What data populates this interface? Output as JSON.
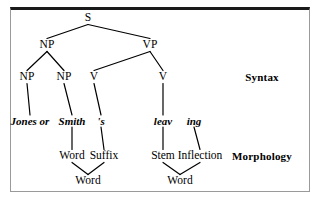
{
  "figure": {
    "border_color": "#9a9a9a",
    "top_border_color": "#1a1a1a",
    "line_color": "#000000",
    "background": "#ffffff"
  },
  "tiers": {
    "syntax_label": "Syntax",
    "morphology_label": "Morphology"
  },
  "tree": {
    "type": "constituency-tree",
    "nodes": [
      {
        "id": "S",
        "label": "S",
        "x": 88,
        "y": 18,
        "kind": "category"
      },
      {
        "id": "NP1",
        "label": "NP",
        "x": 47,
        "y": 45,
        "kind": "category"
      },
      {
        "id": "VP",
        "label": "VP",
        "x": 150,
        "y": 45,
        "kind": "category"
      },
      {
        "id": "NP2",
        "label": "NP",
        "x": 27,
        "y": 77,
        "kind": "category"
      },
      {
        "id": "NP3",
        "label": "NP",
        "x": 64,
        "y": 77,
        "kind": "category"
      },
      {
        "id": "V1",
        "label": "V",
        "x": 94,
        "y": 77,
        "kind": "category"
      },
      {
        "id": "V2",
        "label": "V",
        "x": 163,
        "y": 77,
        "kind": "category"
      },
      {
        "id": "w-jones",
        "label": "Jones or",
        "x": 30,
        "y": 121,
        "kind": "word"
      },
      {
        "id": "w-smith",
        "label": "Smith",
        "x": 72,
        "y": 121,
        "kind": "word"
      },
      {
        "id": "w-s",
        "label": "'s",
        "x": 101,
        "y": 121,
        "kind": "word"
      },
      {
        "id": "w-leav",
        "label": "leav",
        "x": 163,
        "y": 121,
        "kind": "word"
      },
      {
        "id": "w-ing",
        "label": "ing",
        "x": 194,
        "y": 121,
        "kind": "word"
      },
      {
        "id": "m-word1",
        "label": "Word",
        "x": 72,
        "y": 156,
        "kind": "morph"
      },
      {
        "id": "m-suffix",
        "label": "Suffix",
        "x": 104,
        "y": 156,
        "kind": "morph"
      },
      {
        "id": "m-stem",
        "label": "Stem",
        "x": 163,
        "y": 156,
        "kind": "morph"
      },
      {
        "id": "m-infl",
        "label": "Inflection",
        "x": 200,
        "y": 156,
        "kind": "morph"
      },
      {
        "id": "m-word2",
        "label": "Word",
        "x": 88,
        "y": 181,
        "kind": "morph"
      },
      {
        "id": "m-word3",
        "label": "Word",
        "x": 180,
        "y": 181,
        "kind": "morph"
      }
    ],
    "edges": [
      {
        "from": "S",
        "to": "NP1"
      },
      {
        "from": "S",
        "to": "VP"
      },
      {
        "from": "NP1",
        "to": "NP2"
      },
      {
        "from": "NP1",
        "to": "NP3"
      },
      {
        "from": "VP",
        "to": "V1"
      },
      {
        "from": "VP",
        "to": "V2"
      },
      {
        "from": "NP2",
        "to": "w-jones"
      },
      {
        "from": "NP3",
        "to": "w-smith"
      },
      {
        "from": "V1",
        "to": "w-s"
      },
      {
        "from": "V2",
        "to": "w-leav"
      },
      {
        "from": "w-smith",
        "to": "m-word1"
      },
      {
        "from": "w-s",
        "to": "m-suffix"
      },
      {
        "from": "w-leav",
        "to": "m-stem"
      },
      {
        "from": "w-ing",
        "to": "m-infl"
      },
      {
        "from": "m-word1",
        "to": "m-word2"
      },
      {
        "from": "m-suffix",
        "to": "m-word2"
      },
      {
        "from": "m-stem",
        "to": "m-word3"
      },
      {
        "from": "m-infl",
        "to": "m-word3"
      }
    ]
  }
}
